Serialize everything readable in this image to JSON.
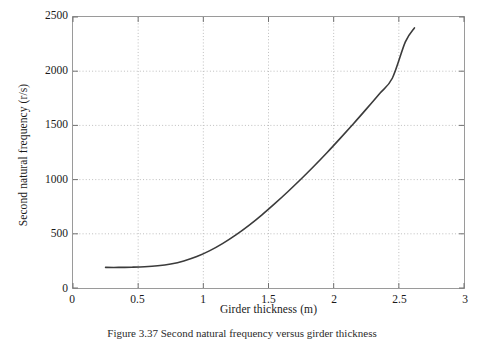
{
  "figure": {
    "caption": "Figure 3.37 Second natural frequency versus girder thickness"
  },
  "chart_data": {
    "type": "line",
    "title": "",
    "xlabel": "Girder thickness (m)",
    "ylabel": "Second natural frequency (r/s)",
    "xlim": [
      0,
      3
    ],
    "ylim": [
      0,
      2500
    ],
    "xticks": [
      "0",
      "0.5",
      "1",
      "1.5",
      "2",
      "2.5",
      "3"
    ],
    "xtick_values": [
      0,
      0.5,
      1,
      1.5,
      2,
      2.5,
      3
    ],
    "yticks": [
      "0",
      "500",
      "1000",
      "1500",
      "2000",
      "2500"
    ],
    "ytick_values": [
      0,
      500,
      1000,
      1500,
      2000,
      2500
    ],
    "grid": true,
    "grid_style": "dotted",
    "legend": null,
    "series": [
      {
        "name": "Second natural frequency",
        "color": "#3b3b3b",
        "line_width": 1.6,
        "x": [
          0.25,
          0.35,
          0.45,
          0.55,
          0.65,
          0.75,
          0.85,
          0.95,
          1.05,
          1.15,
          1.25,
          1.35,
          1.45,
          1.55,
          1.65,
          1.75,
          1.85,
          1.95,
          2.05,
          2.15,
          2.25,
          2.35,
          2.45,
          2.55,
          2.62
        ],
        "y": [
          190,
          190,
          192,
          196,
          205,
          222,
          250,
          290,
          345,
          412,
          490,
          578,
          675,
          780,
          890,
          1005,
          1125,
          1250,
          1380,
          1513,
          1650,
          1790,
          1935,
          2270,
          2400
        ]
      }
    ]
  }
}
